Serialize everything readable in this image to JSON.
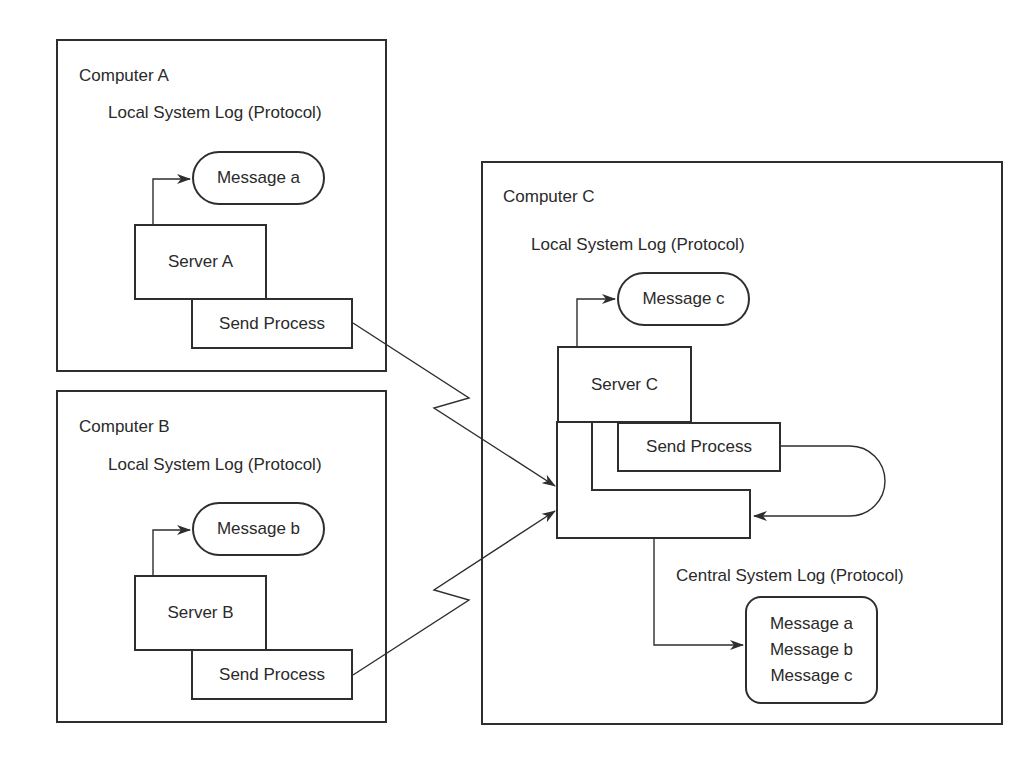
{
  "computers": {
    "a": {
      "title": "Computer A",
      "log_label": "Local System Log (Protocol)",
      "message": "Message a",
      "server": "Server A",
      "send_process": "Send Process"
    },
    "b": {
      "title": "Computer B",
      "log_label": "Local System Log (Protocol)",
      "message": "Message b",
      "server": "Server B",
      "send_process": "Send Process"
    },
    "c": {
      "title": "Computer C",
      "log_label": "Local System Log (Protocol)",
      "message": "Message c",
      "server": "Server C",
      "send_process": "Send Process",
      "collector_process": "Collector Process",
      "central_log_label": "Central System Log (Protocol)",
      "central_messages": [
        "Message a",
        "Message b",
        "Message c"
      ]
    }
  },
  "colors": {
    "stroke": "#2e2e2e",
    "text": "#2a2a2a",
    "background": "#ffffff"
  }
}
